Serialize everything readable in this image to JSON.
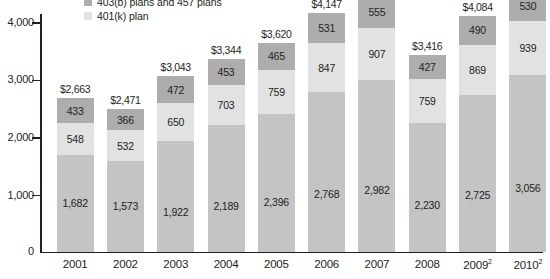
{
  "legend": {
    "items": [
      {
        "label": "403(b) plans and 457 plans",
        "color": "#adadad",
        "swatch_name": "legend-swatch-403b-457"
      },
      {
        "label": "401(k) plan",
        "color": "#e2e2e2",
        "swatch_name": "legend-swatch-401k"
      }
    ]
  },
  "axis": {
    "y_ticks": [
      "4,000",
      "3,000",
      "2,000",
      "1,000"
    ],
    "zero_label": "0"
  },
  "chart_data": {
    "type": "bar",
    "title": "",
    "subtitle": "",
    "xlabel": "",
    "ylabel": "",
    "ylim": [
      0,
      4400
    ],
    "grid": false,
    "stacked": true,
    "legend_position": "top-left",
    "categories": [
      "2001",
      "2002",
      "2003",
      "2004",
      "2005",
      "2006",
      "2007",
      "2008",
      "2009",
      "2010"
    ],
    "category_labels": [
      "2001",
      "2002",
      "2003",
      "2004",
      "2005",
      "2006",
      "2007",
      "2008",
      "2009²",
      "2010²"
    ],
    "series": [
      {
        "name": "Bottom segment",
        "color": "#c4c4c4",
        "values": [
          1682,
          1573,
          1922,
          2189,
          2396,
          2768,
          2982,
          2230,
          2725,
          3056
        ]
      },
      {
        "name": "401(k) plan",
        "color": "#e2e2e2",
        "values": [
          548,
          532,
          650,
          703,
          759,
          847,
          907,
          759,
          869,
          939
        ]
      },
      {
        "name": "403(b) plans and 457 plans",
        "color": "#adadad",
        "values": [
          433,
          366,
          472,
          453,
          465,
          531,
          555,
          427,
          490,
          530
        ]
      }
    ],
    "totals": [
      "$2,663",
      "$2,471",
      "$3,043",
      "$3,344",
      "$3,620",
      "$4,147",
      "",
      "$3,416",
      "$4,084",
      ""
    ],
    "total_values": [
      2663,
      2471,
      3043,
      3344,
      3620,
      4147,
      4444,
      3416,
      4084,
      4525
    ],
    "value_labels": [
      {
        "year": "2001",
        "bottom": "1,682",
        "middle": "548",
        "top": "433",
        "total": "$2,663"
      },
      {
        "year": "2002",
        "bottom": "1,573",
        "middle": "532",
        "top": "366",
        "total": "$2,471"
      },
      {
        "year": "2003",
        "bottom": "1,922",
        "middle": "650",
        "top": "472",
        "total": "$3,043"
      },
      {
        "year": "2004",
        "bottom": "2,189",
        "middle": "703",
        "top": "453",
        "total": "$3,344"
      },
      {
        "year": "2005",
        "bottom": "2,396",
        "middle": "759",
        "top": "465",
        "total": "$3,620"
      },
      {
        "year": "2006",
        "bottom": "2,768",
        "middle": "847",
        "top": "531",
        "total": "$4,147"
      },
      {
        "year": "2007",
        "bottom": "2,982",
        "middle": "907",
        "top": "555",
        "total": ""
      },
      {
        "year": "2008",
        "bottom": "2,230",
        "middle": "759",
        "top": "427",
        "total": "$3,416"
      },
      {
        "year": "2009",
        "bottom": "2,725",
        "middle": "869",
        "top": "490",
        "total": "$4,084"
      },
      {
        "year": "2010",
        "bottom": "3,056",
        "middle": "939",
        "top": "530",
        "total": ""
      }
    ]
  }
}
